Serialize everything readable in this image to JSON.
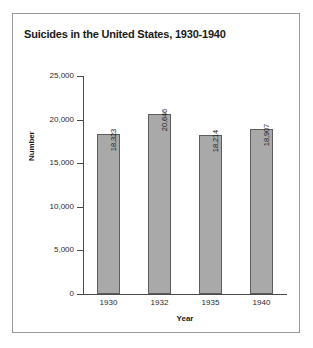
{
  "figure": {
    "border_color": "#9a9a9a",
    "background": "#ffffff"
  },
  "chart_data": {
    "type": "bar",
    "title": "Suicides in the United States, 1930-1940",
    "xlabel": "Year",
    "ylabel": "Number",
    "categories": [
      "1930",
      "1932",
      "1935",
      "1940"
    ],
    "values": [
      18323,
      20646,
      18214,
      18907
    ],
    "value_labels": [
      "18,323",
      "20,646",
      "18,214",
      "18,907"
    ],
    "ylim": [
      0,
      25000
    ],
    "ytick_values": [
      0,
      5000,
      10000,
      15000,
      20000,
      25000
    ],
    "ytick_labels": [
      "0",
      "5,000",
      "10,000",
      "15,000",
      "20,000",
      "25,000"
    ],
    "grid": false,
    "legend": null,
    "bar_fill_color": "#a9a9a9",
    "bar_edge_color": "#5d5d5d",
    "axis_color": "#4a4a4a",
    "value_label_rotation": 90
  }
}
